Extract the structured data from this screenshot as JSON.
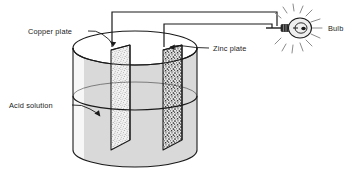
{
  "figure": {
    "name": "simple-voltaic-cell-diagram",
    "background_color": "#ffffff",
    "ink_color": "#1a1a1a"
  },
  "labels": {
    "copper_plate": "Copper plate",
    "zinc_plate": "Zinc plate",
    "acid_solution": "Acid solution",
    "bulb": "Bulb"
  },
  "components": {
    "beaker": {
      "name": "glass-beaker",
      "liquid_fill_color": "#d9d9d9",
      "outline_color": "#1a1a1a"
    },
    "copper_plate": {
      "name": "copper-electrode-plate",
      "stipple": "fine-light",
      "fill_color": "#efefef"
    },
    "zinc_plate": {
      "name": "zinc-electrode-plate",
      "stipple": "coarse-dark",
      "fill_color": "#e4e4e4"
    },
    "wire_copper": {
      "name": "copper-lead-wire",
      "color": "#1a1a1a"
    },
    "wire_zinc": {
      "name": "zinc-lead-wire",
      "color": "#1a1a1a"
    },
    "bulb": {
      "name": "incandescent-light-bulb",
      "glass_color": "#efefef",
      "base_color": "#2b2b2b",
      "ray_color": "#8c8c8c"
    }
  }
}
